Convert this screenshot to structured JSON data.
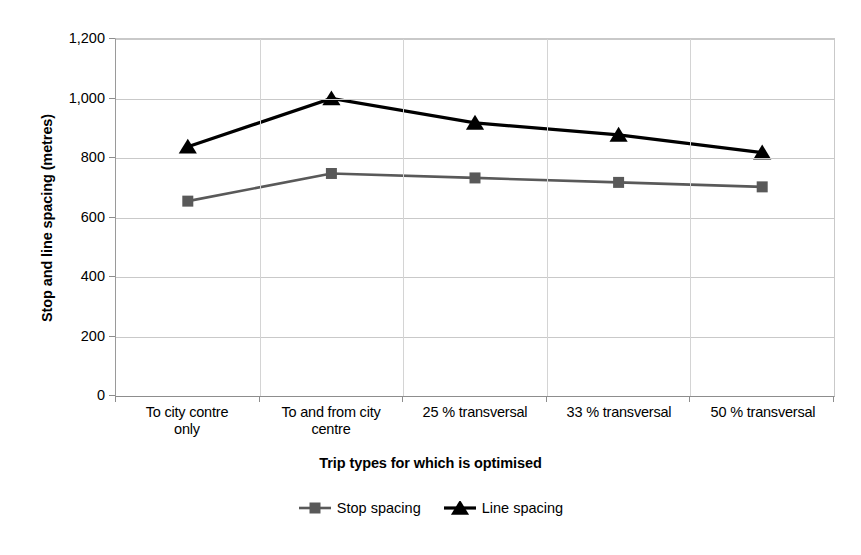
{
  "chart_data": {
    "type": "line",
    "title": "",
    "xlabel": "Trip types for which is optimised",
    "ylabel": "Stop and line spacing (metres)",
    "categories": [
      "To city contre only",
      "To and from city centre",
      "25 % transversal",
      "33 % transversal",
      "50 % transversal"
    ],
    "category_lines": [
      [
        "To city contre",
        "only"
      ],
      [
        "To and from city",
        "centre"
      ],
      [
        "25 % transversal",
        ""
      ],
      [
        "33 % transversal",
        ""
      ],
      [
        "50 % transversal",
        ""
      ]
    ],
    "series": [
      {
        "name": "Stop spacing",
        "marker": "square",
        "color": "#595959",
        "values": [
          655,
          748,
          733,
          718,
          703
        ]
      },
      {
        "name": "Line spacing",
        "marker": "triangle",
        "color": "#000000",
        "values": [
          838,
          1000,
          918,
          878,
          818
        ]
      }
    ],
    "ylim": [
      0,
      1200
    ],
    "yticks": [
      0,
      200,
      400,
      600,
      800,
      1000,
      1200
    ],
    "ytick_labels": [
      "0",
      "200",
      "400",
      "600",
      "800",
      "1,000",
      "1,200"
    ],
    "grid": true,
    "legend_position": "bottom"
  },
  "legend": {
    "items": [
      {
        "label": "Stop spacing",
        "marker": "square-marker-icon"
      },
      {
        "label": "Line spacing",
        "marker": "triangle-marker-icon"
      }
    ]
  },
  "colors": {
    "stop_spacing": "#595959",
    "line_spacing": "#000000",
    "gridline": "#c9c9c9",
    "axis": "#8d8d8d",
    "background": "#ffffff"
  }
}
